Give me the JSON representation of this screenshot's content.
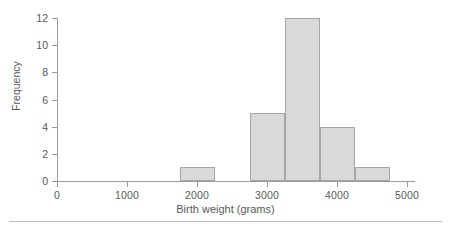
{
  "chart_data": {
    "type": "bar",
    "title": "",
    "subtitle": "",
    "xlabel": "Birth weight (grams)",
    "ylabel": "Frequency",
    "xlim": [
      0,
      5100
    ],
    "ylim": [
      0,
      12
    ],
    "grid": false,
    "legend": null,
    "bin_width": 500,
    "categories": [
      "1750-2250",
      "2750-3250",
      "3250-3750",
      "3750-4250",
      "4250-4750"
    ],
    "values": [
      1,
      5,
      12,
      4,
      1
    ],
    "bins": [
      {
        "label": "1750-2250",
        "start": 1750,
        "end": 2250,
        "value": 1
      },
      {
        "label": "2750-3250",
        "start": 2750,
        "end": 3250,
        "value": 5
      },
      {
        "label": "3250-3750",
        "start": 3250,
        "end": 3750,
        "value": 12
      },
      {
        "label": "3750-4250",
        "start": 3750,
        "end": 4250,
        "value": 4
      },
      {
        "label": "4250-4750",
        "start": 4250,
        "end": 4750,
        "value": 1
      }
    ],
    "x_ticks": [
      {
        "value": 0,
        "label": "0"
      },
      {
        "value": 1000,
        "label": "1000"
      },
      {
        "value": 2000,
        "label": "2000"
      },
      {
        "value": 3000,
        "label": "3000"
      },
      {
        "value": 4000,
        "label": "4000"
      },
      {
        "value": 5000,
        "label": "5000"
      }
    ],
    "y_ticks": [
      {
        "value": 0,
        "label": "0"
      },
      {
        "value": 2,
        "label": "2"
      },
      {
        "value": 4,
        "label": "4"
      },
      {
        "value": 6,
        "label": "6"
      },
      {
        "value": 8,
        "label": "8"
      },
      {
        "value": 10,
        "label": "10"
      },
      {
        "value": 12,
        "label": "12"
      }
    ],
    "colors": {
      "bar_fill": "#d9d9d9",
      "bar_stroke": "#a6a6a6",
      "axis": "#9b9b9e",
      "text": "#58595b",
      "rule": "#bcbcbe",
      "background": "#ffffff"
    }
  }
}
